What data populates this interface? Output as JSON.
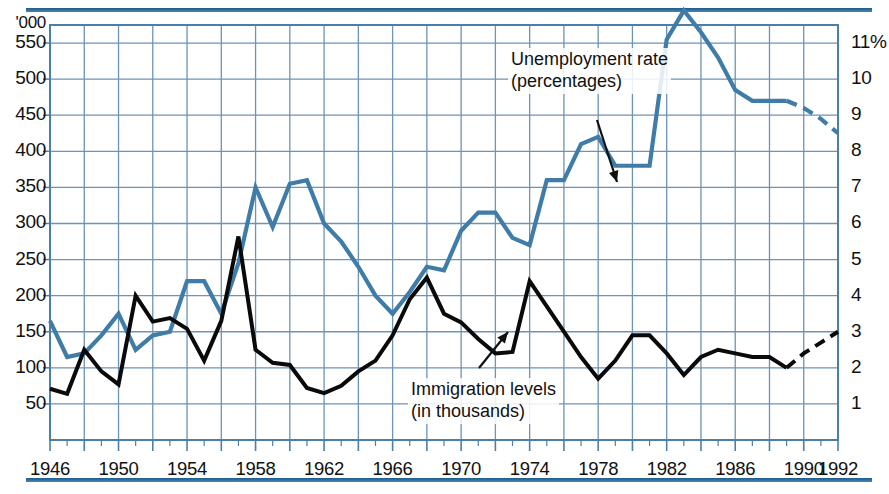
{
  "chart_data": {
    "type": "line",
    "title": "",
    "xlabel": "",
    "ylabel_left": "'000",
    "ylabel_right": "%",
    "grid": true,
    "legend_position": "inline-annotations",
    "xlim": [
      1946,
      1992
    ],
    "x_tick_labels": [
      "1946",
      "1950",
      "1954",
      "1958",
      "1962",
      "1966",
      "1970",
      "1974",
      "1978",
      "1982",
      "1986",
      "1990",
      "1992"
    ],
    "x_tick_values": [
      1946,
      1950,
      1954,
      1958,
      1962,
      1966,
      1970,
      1974,
      1978,
      1982,
      1986,
      1990,
      1992
    ],
    "left_axis": {
      "label": "'000",
      "ylim": [
        0,
        575
      ],
      "ticks": [
        50,
        100,
        150,
        200,
        250,
        300,
        350,
        400,
        450,
        500,
        550
      ],
      "tick_labels": [
        "50",
        "100",
        "150",
        "200",
        "250",
        "300",
        "350",
        "400",
        "450",
        "500",
        "550"
      ]
    },
    "right_axis": {
      "label": "11%",
      "ylim": [
        0,
        11.5
      ],
      "ticks": [
        1,
        2,
        3,
        4,
        5,
        6,
        7,
        8,
        9,
        10,
        11
      ],
      "tick_labels": [
        "1",
        "2",
        "3",
        "4",
        "5",
        "6",
        "7",
        "8",
        "9",
        "10",
        "11%"
      ]
    },
    "series": [
      {
        "name": "Unemployment rate (percentages)",
        "axis": "right",
        "color": "#3f7ca8",
        "annotation": "Unemployment rate\n(percentages)",
        "x": [
          1946,
          1947,
          1948,
          1949,
          1950,
          1951,
          1952,
          1953,
          1954,
          1955,
          1956,
          1957,
          1958,
          1959,
          1960,
          1961,
          1962,
          1963,
          1964,
          1965,
          1966,
          1967,
          1968,
          1969,
          1970,
          1971,
          1972,
          1973,
          1974,
          1975,
          1976,
          1977,
          1978,
          1979,
          1980,
          1981,
          1982,
          1983,
          1984,
          1985,
          1986,
          1987,
          1988,
          1989,
          1990,
          1991,
          1992
        ],
        "values": [
          3.3,
          2.3,
          2.4,
          2.9,
          3.5,
          2.5,
          2.9,
          3.0,
          4.4,
          4.4,
          3.5,
          4.9,
          7.0,
          5.9,
          7.1,
          7.2,
          6.0,
          5.5,
          4.8,
          4.0,
          3.5,
          4.1,
          4.8,
          4.7,
          5.8,
          6.3,
          6.3,
          5.6,
          5.4,
          7.2,
          7.2,
          8.2,
          8.4,
          7.6,
          7.6,
          7.6,
          11.1,
          11.9,
          11.3,
          10.6,
          9.7,
          9.4,
          9.4,
          9.4,
          9.2,
          8.9,
          8.5
        ],
        "dashed_from": 1989
      },
      {
        "name": "Immigration levels (in thousands)",
        "axis": "left",
        "color": "#0a0a0a",
        "annotation": "Immigration levels\n(in thousands)",
        "x": [
          1946,
          1947,
          1948,
          1949,
          1950,
          1951,
          1952,
          1953,
          1954,
          1955,
          1956,
          1957,
          1958,
          1959,
          1960,
          1961,
          1962,
          1963,
          1964,
          1965,
          1966,
          1967,
          1968,
          1969,
          1970,
          1971,
          1972,
          1973,
          1974,
          1975,
          1976,
          1977,
          1978,
          1979,
          1980,
          1981,
          1982,
          1983,
          1984,
          1985,
          1986,
          1987,
          1988,
          1989,
          1990,
          1991,
          1992
        ],
        "values": [
          71,
          64,
          125,
          95,
          77,
          200,
          164,
          169,
          154,
          110,
          165,
          282,
          125,
          107,
          104,
          72,
          65,
          75,
          95,
          110,
          145,
          195,
          225,
          175,
          163,
          140,
          120,
          122,
          220,
          185,
          150,
          115,
          85,
          110,
          145,
          145,
          120,
          90,
          115,
          125,
          120,
          115,
          115,
          100,
          120,
          135,
          150
        ],
        "dashed_from": 1989
      }
    ],
    "annotations": [
      {
        "name": "unemployment-annotation",
        "text_line1": "Unemployment rate",
        "text_line2": "(percentages)"
      },
      {
        "name": "immigration-annotation",
        "text_line1": "Immigration levels",
        "text_line2": "(in thousands)"
      }
    ],
    "colors": {
      "grid": "#6d93b5",
      "frame": "#4b7fa8",
      "rule": "#2a6a9a",
      "blue_series": "#3f7ca8",
      "black_series": "#0a0a0a",
      "background": "#ffffff"
    }
  }
}
